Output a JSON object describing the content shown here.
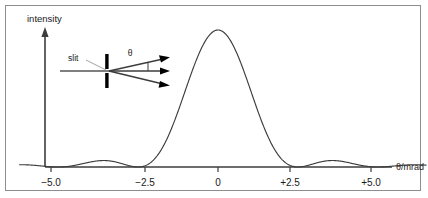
{
  "figure": {
    "background_color": "#ffffff",
    "frame_color": "#8d8d8d",
    "ink_color": "#3c3c3c",
    "diagram_color": "#000000"
  },
  "labels": {
    "y_axis_title": "intensity",
    "x_axis_title": "θ/mrad",
    "slit_label": "slit",
    "theta_label": "θ"
  },
  "chart_data": {
    "type": "line",
    "title": "",
    "subtitle": "",
    "xlabel": "θ/mrad",
    "ylabel": "intensity",
    "xlim": [
      -6.2,
      6.5
    ],
    "ylim": [
      0,
      1.08
    ],
    "grid": false,
    "legend": null,
    "x_ticks": [
      -5.0,
      -2.5,
      0,
      2.5,
      5.0
    ],
    "x_tick_labels": [
      "−5.0",
      "−2.5",
      "0",
      "+2.5",
      "+5.0"
    ],
    "y_ticks": [],
    "y_tick_labels": [],
    "series": [
      {
        "name": "single-slit diffraction intensity",
        "function": "sinc^2",
        "first_minimum_mrad": 2.5,
        "central_maximum_mrad": 0,
        "central_maximum_value": 1.0,
        "minima_mrad": [
          -5.0,
          -2.5,
          2.5,
          5.0
        ],
        "secondary_maxima_mrad": [
          -3.75,
          3.75
        ],
        "secondary_maxima_value": 0.045,
        "x": [
          -6.2,
          -5.9,
          -5.6,
          -5.3,
          -5.0,
          -4.7,
          -4.4,
          -4.1,
          -3.75,
          -3.4,
          -3.1,
          -2.8,
          -2.5,
          -2.2,
          -1.9,
          -1.6,
          -1.3,
          -1.0,
          -0.7,
          -0.4,
          0.0,
          0.4,
          0.7,
          1.0,
          1.3,
          1.6,
          1.9,
          2.2,
          2.5,
          2.8,
          3.1,
          3.4,
          3.75,
          4.1,
          4.4,
          4.7,
          5.0,
          5.3,
          5.6,
          5.9,
          6.2
        ],
        "y": [
          0.013,
          0.018,
          0.016,
          0.008,
          0.0,
          0.012,
          0.031,
          0.043,
          0.045,
          0.039,
          0.025,
          0.009,
          0.0,
          0.031,
          0.106,
          0.217,
          0.36,
          0.517,
          0.683,
          0.852,
          1.0,
          0.852,
          0.683,
          0.517,
          0.36,
          0.217,
          0.106,
          0.031,
          0.0,
          0.009,
          0.025,
          0.039,
          0.045,
          0.043,
          0.031,
          0.012,
          0.0,
          0.008,
          0.016,
          0.018,
          0.013
        ]
      }
    ]
  },
  "inset_diagram": {
    "name": "single-slit-diffraction-schematic",
    "elements": [
      "incident-ray",
      "slit-aperture",
      "diffracted-ray-up",
      "diffracted-ray-straight",
      "diffracted-ray-down",
      "angle-marker"
    ],
    "ray_count": 3
  }
}
